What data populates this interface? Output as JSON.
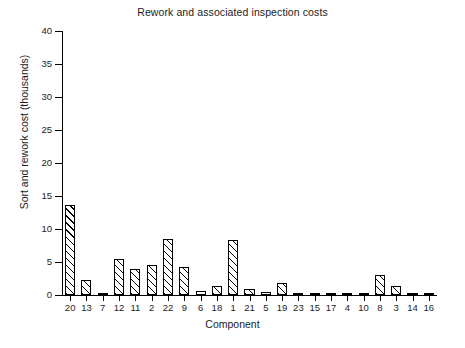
{
  "chart_data": {
    "type": "bar",
    "title": "Rework and associated inspection costs",
    "xlabel": "Component",
    "ylabel": "Sort and rework cost (thousands)",
    "categories": [
      "20",
      "13",
      "7",
      "12",
      "11",
      "2",
      "22",
      "9",
      "6",
      "18",
      "1",
      "21",
      "5",
      "19",
      "23",
      "15",
      "17",
      "4",
      "10",
      "8",
      "3",
      "14",
      "16"
    ],
    "values": [
      13.7,
      2.3,
      0.15,
      5.4,
      4.0,
      4.5,
      8.5,
      4.2,
      0.6,
      1.3,
      8.3,
      0.9,
      0.4,
      1.8,
      0.15,
      0.1,
      0.1,
      0.35,
      0.1,
      3.0,
      1.3,
      0.3,
      0.1
    ],
    "ylim": [
      0,
      40
    ],
    "yticks": [
      0,
      5,
      10,
      15,
      20,
      25,
      30,
      35,
      40
    ],
    "ytick_labels": [
      "0",
      "5",
      "10",
      "15",
      "20",
      "25",
      "30",
      "35",
      "40"
    ],
    "grid": false,
    "legend": null,
    "bar_style": {
      "fill": "#ffffff",
      "edge": "#000000",
      "hatch": "diagonal-forward-slash"
    }
  }
}
